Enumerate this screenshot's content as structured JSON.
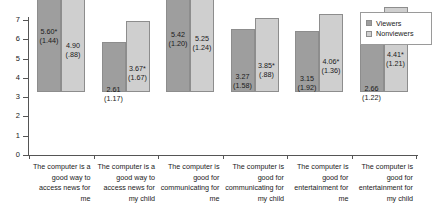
{
  "chart_data": {
    "type": "bar",
    "title": "",
    "xlabel": "",
    "ylabel": "",
    "ylim": [
      0,
      7
    ],
    "yticks": [
      "0",
      "1",
      "2",
      "3",
      "4",
      "5",
      "6",
      "7"
    ],
    "grid": false,
    "legend_position": "top-right",
    "categories": [
      "The computer is a good way to access news for me",
      "The computer is a good way to access news for my child",
      "The computer is good for communicating for me",
      "The computer is good for communicating for my child",
      "The computer is good for entertainment for me",
      "The computer is good for entertainment for my child"
    ],
    "series": [
      {
        "name": "Viewers",
        "color": "#9e9e9e",
        "values": [
          5.6,
          2.61,
          5.42,
          3.27,
          3.15,
          2.66
        ],
        "value_labels": [
          "5.60*",
          "2.61",
          "5.42",
          "3.27",
          "3.15",
          "2.66"
        ],
        "sd_labels": [
          "(1.44)",
          "(1.17)",
          "(1.20)",
          "(1.58)",
          "(1.92)",
          "(1.22)"
        ]
      },
      {
        "name": "Nonviewers",
        "color": "#cfcfcf",
        "values": [
          4.9,
          3.67,
          5.25,
          3.85,
          4.06,
          4.41
        ],
        "value_labels": [
          "4.90",
          "3.67*",
          "5.25",
          "3.85*",
          "4.06*",
          "4.41*"
        ],
        "sd_labels": [
          "(.88)",
          "(1.67)",
          "(1.24)",
          "(.88)",
          "(1.36)",
          "(1.21)"
        ]
      }
    ]
  },
  "legend": {
    "items": [
      {
        "label": "Viewers",
        "swatch": "viewers-swatch"
      },
      {
        "label": "Nonviewers",
        "swatch": "nonviewers-swatch"
      }
    ]
  },
  "axis": {
    "y_ticks": [
      "7",
      "6",
      "5",
      "4",
      "3",
      "2",
      "1",
      "0"
    ]
  }
}
